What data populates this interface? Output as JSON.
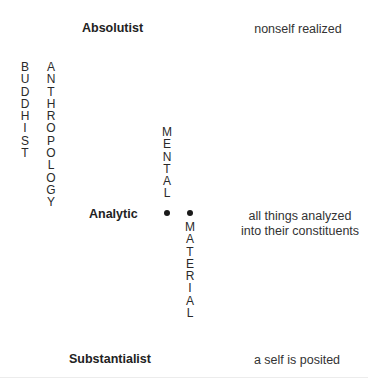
{
  "diagram": {
    "levels": {
      "top": {
        "label": "Absolutist",
        "description": "nonself realized"
      },
      "middle": {
        "label": "Analytic",
        "description_line1": "all things analyzed",
        "description_line2": "into their constituents"
      },
      "bottom": {
        "label": "Substantialist",
        "description": "a self is posited"
      }
    },
    "vertical_labels": {
      "buddhist": [
        "B",
        "U",
        "D",
        "D",
        "H",
        "I",
        "S",
        "T"
      ],
      "anthropology": [
        "A",
        "N",
        "T",
        "H",
        "R",
        "O",
        "P",
        "O",
        "L",
        "O",
        "G",
        "Y"
      ],
      "mental": [
        "M",
        "E",
        "N",
        "T",
        "A",
        "L"
      ],
      "material": [
        "M",
        "A",
        "T",
        "E",
        "R",
        "I",
        "A",
        "L"
      ]
    },
    "markers": {
      "mental_dot": "dot",
      "material_dot": "dot"
    }
  }
}
